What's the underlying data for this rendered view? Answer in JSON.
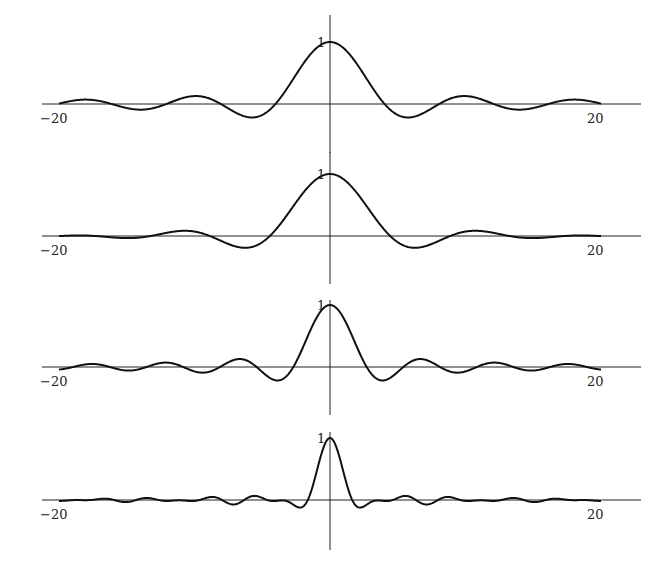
{
  "figure": {
    "layout": {
      "center_x": 330,
      "px_per_unit": 13.55,
      "axis_x_start": 42,
      "axis_x_end": 641,
      "peak_px": 62
    },
    "panels": [
      {
        "id": "panel-1",
        "axis_y": 104,
        "vaxis_top": 15,
        "vaxis_bottom": 153,
        "tick_min_label": "−20",
        "tick_max_label": "20",
        "peak_label": "1"
      },
      {
        "id": "panel-2",
        "axis_y": 236,
        "vaxis_top": 152,
        "vaxis_bottom": 284,
        "tick_min_label": "−20",
        "tick_max_label": "20",
        "peak_label": "1"
      },
      {
        "id": "panel-3",
        "axis_y": 367,
        "vaxis_top": 300,
        "vaxis_bottom": 415,
        "tick_min_label": "−20",
        "tick_max_label": "20",
        "peak_label": "1"
      },
      {
        "id": "panel-4",
        "axis_y": 500,
        "vaxis_top": 432,
        "vaxis_bottom": 550,
        "tick_min_label": "−20",
        "tick_max_label": "20",
        "peak_label": "1"
      }
    ]
  },
  "chart_data": [
    {
      "type": "line",
      "title": "",
      "xlabel": "",
      "ylabel": "",
      "xlim": [
        -20,
        20
      ],
      "ylim": [
        -0.3,
        1
      ],
      "x_tick_labels": [
        "-20",
        "20"
      ],
      "y_tick_labels": [
        "1"
      ],
      "grid": false,
      "legend": null,
      "description": "Sinc-like central lobe, first zeros near x=±4, side lobes ~0.2 decaying slowly",
      "x": [
        -20,
        -16,
        -12,
        -8,
        -6,
        -4,
        -2,
        0,
        2,
        4,
        6,
        8,
        12,
        16,
        20
      ],
      "values": [
        0.03,
        -0.1,
        0.1,
        0.15,
        -0.2,
        0.0,
        0.55,
        1.0,
        0.55,
        0.0,
        -0.2,
        0.15,
        0.1,
        -0.1,
        0.03
      ]
    },
    {
      "type": "line",
      "title": "",
      "xlabel": "",
      "ylabel": "",
      "xlim": [
        -20,
        20
      ],
      "ylim": [
        -0.3,
        1
      ],
      "x_tick_labels": [
        "-20",
        "20"
      ],
      "y_tick_labels": [
        "1"
      ],
      "grid": false,
      "legend": null,
      "description": "Wide main lobe, first zero near x=±4, small irregular side lobes (~0.1)",
      "x": [
        -20,
        -16,
        -12,
        -8,
        -6,
        -4,
        -2,
        0,
        2,
        4,
        6,
        8,
        12,
        16,
        20
      ],
      "values": [
        0.02,
        -0.02,
        0.0,
        0.1,
        -0.08,
        -0.03,
        0.55,
        1.0,
        0.55,
        -0.03,
        -0.08,
        0.1,
        0.0,
        -0.02,
        0.02
      ]
    },
    {
      "type": "line",
      "title": "",
      "xlabel": "",
      "ylabel": "",
      "xlim": [
        -20,
        20
      ],
      "ylim": [
        -0.3,
        1
      ],
      "x_tick_labels": [
        "-20",
        "20"
      ],
      "y_tick_labels": [
        "1"
      ],
      "grid": false,
      "legend": null,
      "description": "Narrower sinc, first zeros near x=±2.7, regular side lobes decaying",
      "x": [
        -20,
        -12,
        -6,
        -4,
        -3,
        -2,
        -1,
        0,
        1,
        2,
        3,
        4,
        6,
        12,
        20
      ],
      "values": [
        0.02,
        0.05,
        0.12,
        -0.2,
        -0.3,
        0.1,
        0.7,
        1.0,
        0.7,
        0.1,
        -0.3,
        -0.2,
        0.12,
        0.05,
        0.02
      ]
    },
    {
      "type": "line",
      "title": "",
      "xlabel": "",
      "ylabel": "",
      "xlim": [
        -20,
        20
      ],
      "ylim": [
        -0.65,
        1
      ],
      "x_tick_labels": [
        "-20",
        "20"
      ],
      "y_tick_labels": [
        "1"
      ],
      "grid": false,
      "legend": null,
      "description": "Very narrow main lobe, deep negative lobes (~-0.6) near x=±4, irregular small ripples",
      "x": [
        -20,
        -12,
        -8,
        -6,
        -4,
        -2,
        -1,
        0,
        1,
        2,
        4,
        6,
        8,
        12,
        20
      ],
      "values": [
        0.0,
        0.05,
        -0.1,
        0.2,
        -0.6,
        0.3,
        0.85,
        1.0,
        0.85,
        0.3,
        -0.6,
        0.2,
        -0.1,
        0.05,
        0.0
      ]
    }
  ],
  "curve_models": [
    {
      "terms": [
        {
          "a": 1.0,
          "w": 0.78
        }
      ],
      "env": 0
    },
    {
      "terms": [
        {
          "a": 0.6,
          "w": 0.78
        },
        {
          "a": 0.4,
          "w": 0.62
        }
      ],
      "env": 0
    },
    {
      "terms": [
        {
          "a": 1.0,
          "w": 1.16
        }
      ],
      "env": 0
    },
    {
      "terms": [
        {
          "a": 0.55,
          "w": 2.4
        },
        {
          "a": 0.45,
          "w": 1.55
        }
      ],
      "env": 0
    }
  ]
}
